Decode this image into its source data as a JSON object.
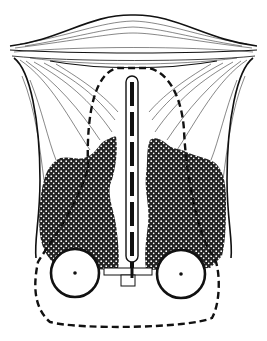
{
  "diagram": {
    "type": "anatomical-schematic",
    "colors": {
      "ink": "#111111",
      "background": "#ffffff",
      "stipple": "#1a1a1a"
    },
    "elements": [
      {
        "id": "top-lens",
        "shape": "lenticular-fiber-band"
      },
      {
        "id": "left-lobe",
        "shape": "flared-cup-with-fibers"
      },
      {
        "id": "right-lobe",
        "shape": "flared-cup-with-fibers"
      },
      {
        "id": "left-cell-mass",
        "shape": "stippled-region"
      },
      {
        "id": "right-cell-mass",
        "shape": "stippled-region"
      },
      {
        "id": "central-rod",
        "shape": "vertical-bar-with-dashed-core"
      },
      {
        "id": "dashed-outline",
        "shape": "dashed-boundary"
      },
      {
        "id": "left-circle",
        "shape": "circle-with-center-dot"
      },
      {
        "id": "right-circle",
        "shape": "circle-with-center-dot"
      },
      {
        "id": "base-plate",
        "shape": "rectangular-t-base"
      }
    ]
  }
}
